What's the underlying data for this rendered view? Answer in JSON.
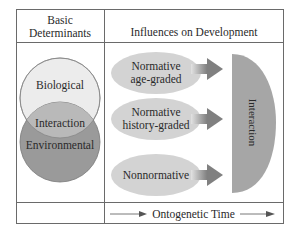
{
  "headers": {
    "left": "Basic\nDeterminants",
    "left_line1": "Basic",
    "left_line2": "Determinants",
    "right": "Influences on Development"
  },
  "determinants": {
    "biological": "Biological",
    "interaction": "Interaction",
    "environmental": "Environmental"
  },
  "influences": [
    {
      "line1": "Normative",
      "line2": "age-graded"
    },
    {
      "line1": "Normative",
      "line2": "history-graded"
    },
    {
      "line1": "Nonnormative",
      "line2": ""
    }
  ],
  "result": {
    "label": "Interaction"
  },
  "footer": {
    "axis_label": "Ontogenetic Time"
  },
  "colors": {
    "biological_fill": "#ececec",
    "interaction_fill": "#b9b9b9",
    "environmental_fill": "#9a9a9a",
    "ellipse_fill": "#d3d3d3",
    "half_oval_fill": "#a6a6a6",
    "arrow_fill": "#8c8c8c",
    "border": "#6a6a6a"
  }
}
